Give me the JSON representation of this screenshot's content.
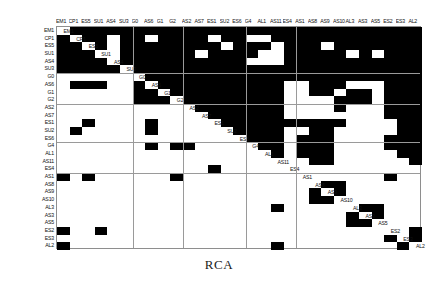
{
  "caption": "RCA",
  "matrix": {
    "name": "RCA",
    "type": "dsm",
    "size": 29,
    "cell_w": 12.586,
    "cell_h": 7.69,
    "colors": {
      "filled": "#000000",
      "empty": "#ffffff",
      "grid": "#9a9a9a",
      "border": "#8e8e8e"
    },
    "labels": [
      "EM1",
      "CP1",
      "ES5",
      "SU1",
      "AS4",
      "SU3",
      "G0",
      "AS6",
      "G1",
      "G2",
      "AS2",
      "AS7",
      "ES1",
      "SU2",
      "ES6",
      "G4",
      "AL1",
      "AS11",
      "ES4",
      "AS1",
      "AS8",
      "AS9",
      "AS10",
      "AL3",
      "AS3",
      "AS5",
      "ES2",
      "ES3",
      "AL2"
    ],
    "column_labels": [
      "EM1",
      "CP1",
      "ES5",
      "SU1",
      "AS4",
      "SU3",
      "G0",
      "AS6",
      "G1",
      "G2",
      "AS2",
      "AS7",
      "ES1",
      "SU2",
      "ES6",
      "G4",
      "AL1",
      "AS11",
      "ES4",
      "AS1",
      "AS8",
      "AS9",
      "AS10",
      "AL3",
      "AS3",
      "AS5",
      "ES2",
      "ES3",
      "AL2"
    ],
    "row_labels": [
      "EM1",
      "CP1",
      "ES5",
      "SU1",
      "AS4",
      "SU3",
      "G0",
      "AS6",
      "G1",
      "G2",
      "AS2",
      "AS7",
      "ES1",
      "SU2",
      "ES6",
      "G4",
      "AL1",
      "AS11",
      "ES4",
      "AS1",
      "AS8",
      "AS9",
      "AS10",
      "AL3",
      "AS3",
      "AS5",
      "ES2",
      "ES3",
      "AL2"
    ],
    "block_splits_cols": [
      6,
      10,
      15,
      19
    ],
    "block_splits_rows": [
      6,
      10,
      15,
      19
    ],
    "cells": [
      [
        0,
        1,
        1,
        1,
        1,
        1,
        1,
        1,
        1,
        1,
        1,
        1,
        1,
        1,
        1,
        1,
        1,
        1,
        1,
        1,
        1,
        1,
        1,
        1,
        1,
        1,
        1,
        1,
        1
      ],
      [
        1,
        0,
        1,
        1,
        0,
        1,
        1,
        0,
        1,
        1,
        1,
        1,
        0,
        1,
        1,
        0,
        0,
        1,
        1,
        1,
        1,
        1,
        1,
        1,
        1,
        1,
        1,
        1,
        1
      ],
      [
        1,
        1,
        0,
        1,
        0,
        1,
        1,
        1,
        1,
        1,
        1,
        1,
        1,
        0,
        1,
        1,
        1,
        0,
        1,
        1,
        1,
        0,
        1,
        1,
        1,
        1,
        1,
        1,
        1
      ],
      [
        1,
        1,
        1,
        0,
        0,
        1,
        1,
        1,
        1,
        1,
        1,
        0,
        1,
        1,
        1,
        1,
        0,
        0,
        1,
        1,
        1,
        1,
        1,
        0,
        1,
        0,
        1,
        1,
        1
      ],
      [
        1,
        1,
        1,
        1,
        0,
        1,
        1,
        1,
        1,
        1,
        1,
        1,
        1,
        1,
        1,
        0,
        0,
        0,
        1,
        1,
        1,
        1,
        1,
        1,
        1,
        1,
        1,
        1,
        1
      ],
      [
        1,
        1,
        1,
        1,
        1,
        0,
        1,
        1,
        1,
        1,
        1,
        1,
        1,
        1,
        1,
        1,
        1,
        1,
        1,
        1,
        1,
        1,
        1,
        1,
        1,
        1,
        1,
        1,
        1
      ],
      [
        0,
        0,
        0,
        0,
        0,
        0,
        0,
        1,
        1,
        1,
        1,
        1,
        1,
        1,
        1,
        1,
        1,
        1,
        1,
        1,
        1,
        1,
        1,
        1,
        1,
        1,
        1,
        1,
        1
      ],
      [
        0,
        1,
        1,
        1,
        0,
        0,
        1,
        0,
        1,
        1,
        1,
        1,
        1,
        1,
        1,
        1,
        1,
        1,
        0,
        0,
        1,
        1,
        1,
        0,
        0,
        0,
        1,
        1,
        1
      ],
      [
        0,
        0,
        0,
        0,
        0,
        0,
        1,
        1,
        0,
        1,
        1,
        1,
        1,
        1,
        1,
        1,
        1,
        1,
        0,
        0,
        1,
        1,
        0,
        1,
        1,
        0,
        1,
        1,
        1
      ],
      [
        0,
        0,
        0,
        0,
        0,
        0,
        1,
        1,
        1,
        0,
        1,
        1,
        1,
        1,
        1,
        1,
        1,
        1,
        0,
        0,
        0,
        0,
        1,
        1,
        1,
        0,
        1,
        1,
        1
      ],
      [
        0,
        0,
        0,
        0,
        0,
        0,
        0,
        0,
        0,
        0,
        0,
        1,
        1,
        1,
        1,
        1,
        1,
        1,
        0,
        0,
        0,
        0,
        1,
        0,
        0,
        0,
        1,
        1,
        1
      ],
      [
        0,
        0,
        0,
        0,
        0,
        0,
        0,
        0,
        0,
        0,
        0,
        0,
        1,
        1,
        1,
        1,
        1,
        1,
        0,
        0,
        0,
        0,
        0,
        0,
        0,
        0,
        1,
        1,
        1
      ],
      [
        0,
        0,
        1,
        0,
        0,
        0,
        0,
        1,
        0,
        0,
        0,
        0,
        0,
        1,
        1,
        1,
        1,
        1,
        1,
        1,
        1,
        1,
        1,
        0,
        0,
        0,
        0,
        1,
        1
      ],
      [
        0,
        1,
        0,
        0,
        0,
        0,
        0,
        1,
        0,
        0,
        0,
        0,
        0,
        0,
        1,
        1,
        1,
        1,
        0,
        0,
        1,
        1,
        0,
        0,
        0,
        0,
        0,
        1,
        1
      ],
      [
        0,
        0,
        0,
        0,
        0,
        0,
        0,
        0,
        0,
        0,
        0,
        0,
        0,
        0,
        0,
        1,
        1,
        1,
        0,
        1,
        1,
        1,
        0,
        0,
        0,
        0,
        1,
        1,
        1
      ],
      [
        0,
        0,
        0,
        0,
        0,
        0,
        0,
        1,
        0,
        1,
        1,
        0,
        0,
        0,
        0,
        0,
        1,
        1,
        0,
        1,
        1,
        1,
        0,
        0,
        0,
        0,
        1,
        1,
        1
      ],
      [
        0,
        0,
        0,
        0,
        0,
        0,
        0,
        0,
        0,
        0,
        0,
        0,
        0,
        0,
        0,
        0,
        0,
        1,
        0,
        1,
        1,
        1,
        0,
        0,
        0,
        0,
        0,
        1,
        1
      ],
      [
        0,
        0,
        0,
        0,
        0,
        0,
        0,
        0,
        0,
        0,
        0,
        0,
        0,
        0,
        0,
        0,
        0,
        0,
        0,
        0,
        1,
        1,
        0,
        0,
        0,
        0,
        0,
        0,
        1
      ],
      [
        0,
        0,
        0,
        0,
        0,
        0,
        0,
        0,
        0,
        0,
        0,
        0,
        1,
        0,
        0,
        0,
        0,
        0,
        0,
        0,
        0,
        0,
        0,
        0,
        0,
        0,
        0,
        0,
        0
      ],
      [
        1,
        0,
        1,
        0,
        0,
        0,
        0,
        0,
        0,
        1,
        0,
        0,
        0,
        0,
        0,
        0,
        0,
        0,
        0,
        0,
        0,
        0,
        0,
        0,
        0,
        0,
        1,
        0,
        0
      ],
      [
        0,
        0,
        0,
        0,
        0,
        0,
        0,
        0,
        0,
        0,
        0,
        0,
        0,
        0,
        0,
        0,
        0,
        0,
        0,
        0,
        0,
        1,
        1,
        0,
        0,
        0,
        0,
        0,
        0
      ],
      [
        0,
        0,
        0,
        0,
        0,
        0,
        0,
        0,
        0,
        0,
        0,
        0,
        0,
        0,
        0,
        0,
        0,
        0,
        0,
        0,
        1,
        0,
        1,
        0,
        0,
        0,
        0,
        0,
        0
      ],
      [
        0,
        0,
        0,
        0,
        0,
        0,
        0,
        0,
        0,
        0,
        0,
        0,
        0,
        0,
        0,
        0,
        0,
        0,
        0,
        0,
        1,
        1,
        0,
        0,
        0,
        0,
        0,
        0,
        0
      ],
      [
        0,
        0,
        0,
        0,
        0,
        0,
        0,
        0,
        0,
        0,
        0,
        0,
        0,
        0,
        0,
        0,
        0,
        1,
        0,
        0,
        0,
        0,
        0,
        0,
        1,
        1,
        0,
        0,
        0
      ],
      [
        0,
        0,
        0,
        0,
        0,
        0,
        0,
        0,
        0,
        0,
        0,
        0,
        0,
        0,
        0,
        0,
        0,
        0,
        0,
        0,
        0,
        0,
        0,
        1,
        0,
        1,
        0,
        0,
        0
      ],
      [
        0,
        0,
        0,
        0,
        0,
        0,
        0,
        0,
        0,
        0,
        0,
        0,
        0,
        0,
        0,
        0,
        0,
        0,
        0,
        0,
        0,
        0,
        0,
        1,
        1,
        0,
        0,
        0,
        0
      ],
      [
        1,
        0,
        0,
        1,
        0,
        0,
        0,
        0,
        0,
        0,
        0,
        0,
        0,
        0,
        0,
        0,
        0,
        0,
        0,
        0,
        0,
        0,
        0,
        0,
        0,
        0,
        0,
        0,
        1
      ],
      [
        0,
        0,
        0,
        0,
        0,
        0,
        0,
        0,
        0,
        0,
        0,
        0,
        0,
        0,
        0,
        0,
        0,
        0,
        0,
        0,
        0,
        0,
        0,
        0,
        0,
        0,
        1,
        0,
        1
      ],
      [
        1,
        0,
        0,
        0,
        0,
        0,
        0,
        0,
        0,
        0,
        0,
        0,
        0,
        0,
        0,
        0,
        0,
        1,
        0,
        0,
        0,
        0,
        0,
        0,
        0,
        0,
        0,
        1,
        0
      ]
    ]
  }
}
